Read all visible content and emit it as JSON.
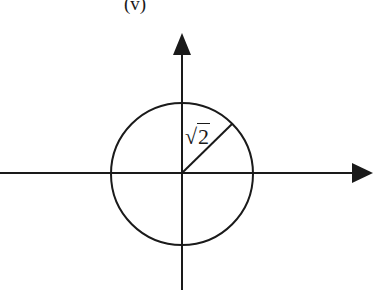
{
  "figure": {
    "part_label": "(v)",
    "radius_label_symbol": "√",
    "radius_label_value": "2",
    "circle": {
      "center_x": 182,
      "center_y": 173,
      "radius": 71
    },
    "axes": {
      "x_axis": {
        "from": [
          0,
          173
        ],
        "to": [
          372,
          173
        ],
        "arrow": "right"
      },
      "y_axis": {
        "from": [
          182,
          290
        ],
        "to": [
          182,
          33
        ],
        "arrow": "up"
      }
    },
    "radius_segment": {
      "from": [
        182,
        173
      ],
      "to": [
        232,
        124
      ],
      "label": "√2"
    },
    "stroke_color": "#1a1a1a",
    "background": "#ffffff"
  }
}
